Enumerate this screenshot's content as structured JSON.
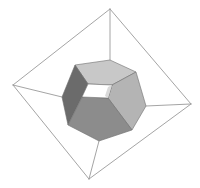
{
  "diagram": {
    "title": "",
    "outer_frame": {
      "vertices": {
        "top": [
          110,
          9
        ],
        "left": [
          13,
          85
        ],
        "right": [
          191,
          104
        ],
        "bottom": [
          89,
          179
        ]
      },
      "stroke_color": "#9a9a9a"
    },
    "connectors": [
      {
        "from": [
          110,
          9
        ],
        "to": [
          110,
          60
        ]
      },
      {
        "from": [
          13,
          85
        ],
        "to": [
          62,
          97
        ]
      },
      {
        "from": [
          191,
          104
        ],
        "to": [
          146,
          106
        ]
      },
      {
        "from": [
          89,
          179
        ],
        "to": [
          99,
          141
        ]
      }
    ],
    "faces": [
      {
        "name": "top-face",
        "color": "#c8c8c8",
        "points": "75,65 110,60 136,72 112,85 88,84"
      },
      {
        "name": "left-face",
        "color": "#6b6b6b",
        "points": "75,65 88,84 82,97 68,125 62,97"
      },
      {
        "name": "right-face",
        "color": "#b4b4b4",
        "points": "136,72 146,106 132,130 108,98 112,85"
      },
      {
        "name": "front-face",
        "color": "#8c8c8c",
        "points": "82,97 108,98 132,130 99,141 68,125"
      },
      {
        "name": "tunnel-hole",
        "color": "#ffffff",
        "points": "88,84 112,85 108,98 82,97"
      },
      {
        "name": "tunnel-inner-wall",
        "color": "#dadada",
        "points": "108,87 112,85 108,98 105,96"
      }
    ]
  }
}
